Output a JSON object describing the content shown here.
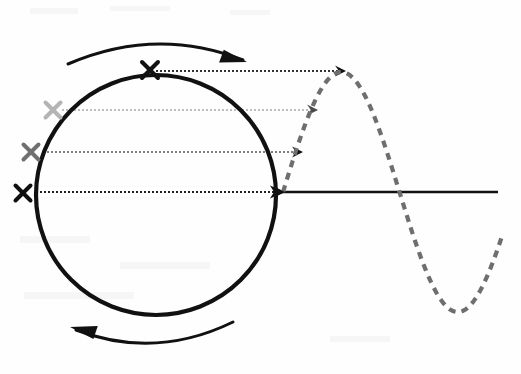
{
  "figure": {
    "width": 521,
    "height": 374,
    "background_color": "#fefefe"
  },
  "chart_data": {
    "type": "line",
    "subtitle": "",
    "xlabel": "",
    "ylabel": "",
    "grid": false,
    "legend_position": "none",
    "axis": {
      "name": "horizontal-axis",
      "color": "#111111",
      "stroke_width": 2.6,
      "x_start": 280,
      "x_end": 498,
      "y": 192,
      "arrow_at_start": true
    },
    "circle": {
      "name": "rotating-circle",
      "center_x": 156,
      "center_y": 195,
      "radius": 120,
      "color": "#111111",
      "stroke_width": 4.2,
      "fill": "none"
    },
    "sine": {
      "name": "sine-wave",
      "color": "#6e6e6e",
      "stroke_width": 4.2,
      "dash": "7 6",
      "amplitude": 120,
      "origin_x": 283,
      "baseline_y": 192,
      "wavelength": 233,
      "phase_deg": 0,
      "x_end": 503,
      "points_deg": [
        0,
        15,
        30,
        45,
        60,
        75,
        90,
        105,
        120,
        135,
        150,
        165,
        180,
        195,
        210,
        225,
        240,
        255,
        270,
        285,
        300,
        315,
        330,
        345,
        355
      ]
    },
    "markers": [
      {
        "name": "marker-x-0deg",
        "label": "x",
        "angle_deg": 180,
        "color": "#111111",
        "x": 23,
        "y": 193,
        "size": 15
      },
      {
        "name": "marker-x-20deg",
        "label": "x",
        "angle_deg": 160,
        "color": "#707070",
        "x": 31,
        "y": 152,
        "size": 15
      },
      {
        "name": "marker-x-45deg",
        "label": "x",
        "angle_deg": 135,
        "color": "#b4b4b4",
        "x": 53,
        "y": 110,
        "size": 15
      },
      {
        "name": "marker-x-90deg",
        "label": "x",
        "angle_deg": 90,
        "color": "#111111",
        "x": 150,
        "y": 70,
        "size": 16
      }
    ],
    "projection_lines": [
      {
        "name": "projection-line-0deg",
        "from_x": 36,
        "to_x": 285,
        "y": 192,
        "color": "#222222",
        "dash": "2 2",
        "stroke_width": 2.0,
        "arrow": true
      },
      {
        "name": "projection-line-20deg",
        "from_x": 43,
        "to_x": 303,
        "y": 152,
        "color": "#555555",
        "dash": "2 2",
        "stroke_width": 1.7,
        "arrow": true
      },
      {
        "name": "projection-line-45deg",
        "from_x": 62,
        "to_x": 318,
        "y": 110,
        "color": "#a8a8a8",
        "dash": "2 2",
        "stroke_width": 1.6,
        "arrow": true
      },
      {
        "name": "projection-line-90deg",
        "from_x": 156,
        "to_x": 346,
        "y": 71,
        "color": "#333333",
        "dash": "2 2",
        "stroke_width": 2.0,
        "arrow": true
      }
    ],
    "rotation_arrows": [
      {
        "name": "rotation-arrow-top",
        "direction": "clockwise",
        "color": "#111111",
        "stroke_width": 3.0,
        "path": "M 68 64 Q 156 26 243 60",
        "tip_x": 247,
        "tip_y": 62
      },
      {
        "name": "rotation-arrow-bottom",
        "direction": "clockwise",
        "color": "#111111",
        "stroke_width": 3.0,
        "path": "M 233 322 Q 155 360 76 330",
        "tip_x": 70,
        "tip_y": 327
      }
    ]
  }
}
